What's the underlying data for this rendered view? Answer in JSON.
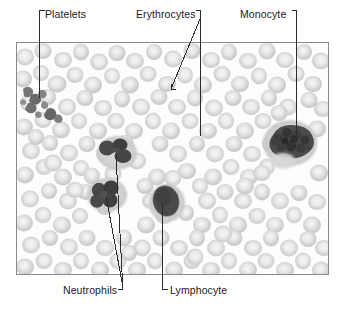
{
  "figure": {
    "kind": "blood-smear-micrograph-with-labels",
    "background_color": "#ffffff",
    "frame": {
      "x": 16,
      "y": 42,
      "width": 311,
      "height": 231,
      "border_color": "#8a8a8a",
      "field_color": "#fdfdfd"
    },
    "palette": {
      "label_text": "#1a1a1a",
      "leader_line": "#2b2b2b",
      "erythrocyte_rim": "#d3d3d3",
      "erythrocyte_center": "#efefef",
      "leukocyte_nucleus": "#555555",
      "leukocyte_cytoplasm": "#cfcfcf",
      "platelet": "#6e6e6e"
    }
  },
  "labels": [
    {
      "id": "platelets",
      "text": "Platelets",
      "text_x": 45,
      "text_y": 14,
      "bracket": "top-left-corner",
      "leader_target": "platelet-cluster"
    },
    {
      "id": "erythrocytes",
      "text": "Erythrocytes",
      "text_x": 136,
      "text_y": 14,
      "bracket": "top-right-corner",
      "leader_target": "erythrocyte-field",
      "leader_count": 2
    },
    {
      "id": "monocyte",
      "text": "Monocyte",
      "text_x": 240,
      "text_y": 14,
      "bracket": "top-right-corner",
      "leader_target": "monocyte-cell"
    },
    {
      "id": "neutrophils",
      "text": "Neutrophils",
      "text_x": 63,
      "text_y": 290,
      "bracket": "bottom-right-corner",
      "leader_target": "neutrophil-cells",
      "leader_count": 2
    },
    {
      "id": "lymphocyte",
      "text": "Lymphocyte",
      "text_x": 168,
      "text_y": 290,
      "bracket": "bottom-left-corner",
      "leader_target": "lymphocyte-cell"
    }
  ],
  "cells": {
    "platelet_cluster": {
      "name": "Platelets",
      "count": 9,
      "center_x": 38,
      "center_y": 99,
      "color": "#6e6e6e",
      "note": "small dark irregular fragments, upper-left of field"
    },
    "monocyte": {
      "name": "Monocyte",
      "center_x": 289,
      "center_y": 139,
      "nucleus_width": 36,
      "nucleus_height": 30,
      "color": "#4f4f4f",
      "note": "large cell, kidney-shaped granular nucleus, right side of field"
    },
    "neutrophil_upper": {
      "name": "Neutrophil",
      "center_x": 116,
      "center_y": 152,
      "lobes": 3,
      "color": "#4a4a4a",
      "note": "multi-lobed nucleus, center-left of field"
    },
    "neutrophil_lower": {
      "name": "Neutrophil",
      "center_x": 106,
      "center_y": 194,
      "lobes": 4,
      "color": "#4a4a4a",
      "note": "multi-lobed nucleus, lower-left of field"
    },
    "lymphocyte": {
      "name": "Lymphocyte",
      "center_x": 165,
      "center_y": 201,
      "nucleus_width": 25,
      "nucleus_height": 31,
      "color": "#4a4a4a",
      "note": "round/oval dense nucleus with thin cytoplasm rim, center of field"
    },
    "erythrocytes": {
      "name": "Erythrocytes",
      "approx_count": 210,
      "color": "#d3d3d3",
      "note": "pale biconcave discs with light central pallor filling the field"
    }
  }
}
